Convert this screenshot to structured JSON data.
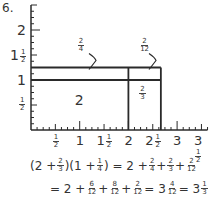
{
  "problem_number": "6.",
  "y_axis": {
    "range": [
      0,
      2.5
    ],
    "labels": [
      {
        "value": 2,
        "whole": "2",
        "frac": null
      },
      {
        "value": 1.5,
        "whole": "1",
        "frac": [
          "1",
          "2"
        ]
      },
      {
        "value": 1,
        "whole": "1",
        "frac": null
      },
      {
        "value": 0.5,
        "whole": "",
        "frac": [
          "1",
          "2"
        ]
      }
    ],
    "minor_step": 0.125
  },
  "x_axis": {
    "range": [
      0,
      3.625
    ],
    "labels": [
      {
        "value": 0.5,
        "whole": "",
        "frac": [
          "1",
          "2"
        ]
      },
      {
        "value": 1,
        "whole": "1",
        "frac": null
      },
      {
        "value": 1.5,
        "whole": "1",
        "frac": [
          "1",
          "2"
        ]
      },
      {
        "value": 2,
        "whole": "2",
        "frac": null
      },
      {
        "value": 2.5,
        "whole": "2",
        "frac": [
          "1",
          "2"
        ]
      },
      {
        "value": 3,
        "whole": "3",
        "frac": null
      },
      {
        "value": 3.5,
        "whole": "3",
        "frac": [
          "1",
          "2"
        ]
      }
    ],
    "minor_step": 0.125
  },
  "rectangle": {
    "width_parts": [
      2,
      0.6667
    ],
    "height_parts": [
      1,
      0.25
    ],
    "region_labels": {
      "main": "2",
      "right": [
        "2",
        "3"
      ],
      "top": [
        "2",
        "4"
      ],
      "corner": [
        "2",
        "12"
      ]
    }
  },
  "equation_line1": {
    "lhs": "(2 + ",
    "lhs_frac1": [
      "2",
      "3"
    ],
    "lhs_mid": ")(1 + ",
    "lhs_frac2": [
      "1",
      "4"
    ],
    "lhs_end": ") = 2 + ",
    "rhs_frac1": [
      "2",
      "4"
    ],
    "plus1": " + ",
    "rhs_frac2": [
      "2",
      "3"
    ],
    "plus2": " + ",
    "rhs_frac3": [
      "2",
      "12"
    ]
  },
  "equation_line2": {
    "start": "= 2 + ",
    "frac1": [
      "6",
      "12"
    ],
    "plus1": " + ",
    "frac2": [
      "8",
      "12"
    ],
    "plus2": " + ",
    "frac3": [
      "2",
      "12"
    ],
    "eq1": " = 3",
    "frac4": [
      "4",
      "12"
    ],
    "eq2": " = 3",
    "frac5": [
      "1",
      "3"
    ]
  },
  "colors": {
    "ink": "#2a2a2a",
    "background": "#ffffff"
  }
}
